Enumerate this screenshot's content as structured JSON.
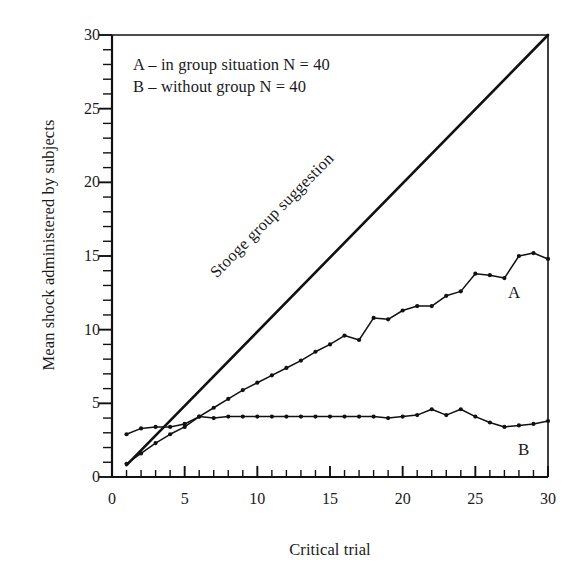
{
  "chart_data": {
    "type": "line",
    "title": "",
    "xlabel": "Critical trial",
    "ylabel": "Mean shock administered by subjects",
    "xlim": [
      0,
      30
    ],
    "ylim": [
      0,
      30
    ],
    "xticks": [
      0,
      5,
      10,
      15,
      20,
      25,
      30
    ],
    "yticks": [
      0,
      5,
      10,
      15,
      20,
      25,
      30
    ],
    "xtick_labels": [
      "0",
      "5",
      "10",
      "15",
      "20",
      "25",
      "30"
    ],
    "ytick_labels": [
      "0",
      "5",
      "10",
      "15",
      "20",
      "25",
      "30"
    ],
    "minor_tick_step": 1,
    "grid": false,
    "legend_position": "upper-left-inside",
    "x": [
      1,
      2,
      3,
      4,
      5,
      6,
      7,
      8,
      9,
      10,
      11,
      12,
      13,
      14,
      15,
      16,
      17,
      18,
      19,
      20,
      21,
      22,
      23,
      24,
      25,
      26,
      27,
      28,
      29,
      30
    ],
    "series": [
      {
        "name": "Stooge group suggestion",
        "label": "Stooge group suggestion",
        "marker": "none",
        "linewidth": 2.6,
        "color": "#111111",
        "x": [
          1,
          30
        ],
        "values": [
          0.8,
          30.0
        ]
      },
      {
        "name": "A",
        "label": "A",
        "legend_text": "A – in group situation N = 40",
        "marker": "dot",
        "linewidth": 1.5,
        "color": "#111111",
        "values": [
          0.9,
          1.6,
          2.3,
          2.9,
          3.4,
          4.1,
          4.7,
          5.3,
          5.9,
          6.4,
          6.9,
          7.4,
          7.9,
          8.5,
          9.0,
          9.6,
          9.3,
          10.8,
          10.7,
          11.3,
          11.6,
          11.6,
          12.3,
          12.6,
          13.8,
          13.7,
          13.5,
          15.0,
          15.2,
          14.8
        ]
      },
      {
        "name": "B",
        "label": "B",
        "legend_text": "B – without group N = 40",
        "marker": "dot",
        "linewidth": 1.5,
        "color": "#111111",
        "values": [
          2.9,
          3.3,
          3.4,
          3.4,
          3.6,
          4.1,
          4.0,
          4.1,
          4.1,
          4.1,
          4.1,
          4.1,
          4.1,
          4.1,
          4.1,
          4.1,
          4.1,
          4.1,
          4.0,
          4.1,
          4.2,
          4.6,
          4.2,
          4.6,
          4.1,
          3.7,
          3.4,
          3.5,
          3.6,
          3.8
        ]
      }
    ],
    "annotations": [
      {
        "text": "Stooge group suggestion",
        "kind": "inline-line-label",
        "rotation": -45
      },
      {
        "text": "A",
        "kind": "curve-end-tag"
      },
      {
        "text": "B",
        "kind": "curve-end-tag"
      }
    ]
  },
  "axes": {
    "y_axis_title": "Mean shock administered by subjects",
    "x_axis_title": "Critical trial"
  },
  "legend": {
    "line_a": "A – in group situation N = 40",
    "line_b": "B – without group N = 40"
  },
  "labels": {
    "diagonal": "Stooge group suggestion",
    "tag_a": "A",
    "tag_b": "B"
  },
  "colors": {
    "ink": "#111111",
    "background": "#ffffff"
  }
}
